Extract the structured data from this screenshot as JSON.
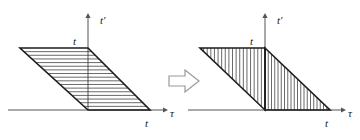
{
  "figure": {
    "transition_icon": "right-block-arrow",
    "left_panel": {
      "name": "parallelogram-panel",
      "vertical_axis_label": "t′",
      "horizontal_axis_label": "τ",
      "top_vertex_label": "t",
      "bottom_vertex_label": "t",
      "shape": "parallelogram",
      "hatching": "horizontal",
      "hatch_count": 16,
      "geometry": {
        "origin_x": 88,
        "origin_y": 110,
        "axis_v_top_y": 18,
        "axis_h_left_x": 8,
        "axis_h_right_x": 163,
        "p_top_left_x": 20,
        "p_top_right_x": 88,
        "p_top_y": 48,
        "p_bottom_left_x": 88,
        "p_bottom_right_x": 150,
        "p_bottom_y": 110
      }
    },
    "right_panel": {
      "name": "triangles-panel",
      "vertical_axis_label": "t′",
      "horizontal_axis_label": "τ",
      "top_vertex_label": "t",
      "bottom_vertex_label": "t",
      "shape": "two-triangles",
      "hatching": "vertical",
      "hatch_count_left": 17,
      "hatch_count_right": 19,
      "geometry": {
        "origin_x": 265,
        "origin_y": 110,
        "axis_v_top_y": 18,
        "axis_h_left_x": 188,
        "axis_h_right_x": 341,
        "tri_left_top_x": 200,
        "tri_left_top_y": 48,
        "tri_left_right_x": 265,
        "tri_right_bottom_x": 330,
        "tri_bottom_y": 110
      }
    },
    "colors": {
      "outline": "#1d1d1d",
      "axis": "#555555",
      "hatch": "#2a2a2a",
      "arrow_fill": "#ffffff",
      "arrow_stroke": "#9a9a9a",
      "background": "#ffffff"
    }
  }
}
